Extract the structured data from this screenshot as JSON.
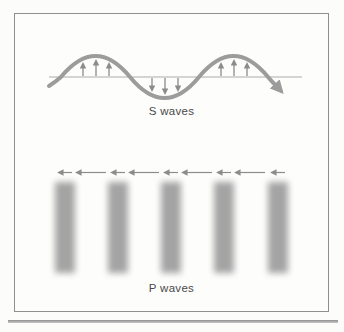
{
  "frame": {
    "border_color": "#8f8f8f",
    "background": "#fdfdfc"
  },
  "s_wave": {
    "label": "S waves",
    "wave_color": "#9c9c9c",
    "axis_color": "#ababab",
    "arrow_color": "#8c8c8c",
    "arrow_groups": [
      {
        "position": "first-crest",
        "direction": "up",
        "count": 3
      },
      {
        "position": "trough",
        "direction": "down",
        "count": 3
      },
      {
        "position": "second-crest",
        "direction": "up",
        "count": 3
      }
    ],
    "wave_end": "arrowhead pointing down-right"
  },
  "p_wave": {
    "label": "P waves",
    "band_color": "#a4a4a4",
    "band_count": 5,
    "band_centers_px": [
      50,
      103,
      156,
      209,
      263
    ],
    "arrow_color": "#8c8c8c",
    "motion_arrows": {
      "short_over_bands": 5,
      "long_between_bands": 4,
      "pointing": "left"
    }
  },
  "divider": {
    "color": "#9a9a9a"
  }
}
